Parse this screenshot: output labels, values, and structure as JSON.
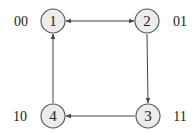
{
  "diagram": {
    "type": "state-graph",
    "nodes": [
      {
        "id": "1",
        "label": "1",
        "code": "00",
        "x": 53,
        "y": 21
      },
      {
        "id": "2",
        "label": "2",
        "code": "01",
        "x": 147,
        "y": 21
      },
      {
        "id": "3",
        "label": "3",
        "code": "11",
        "x": 148,
        "y": 116
      },
      {
        "id": "4",
        "label": "4",
        "code": "10",
        "x": 53,
        "y": 116
      }
    ],
    "edges": [
      {
        "from": "1",
        "to": "2",
        "bidirectional": true
      },
      {
        "from": "2",
        "to": "3",
        "bidirectional": false
      },
      {
        "from": "3",
        "to": "4",
        "bidirectional": false
      },
      {
        "from": "4",
        "to": "1",
        "bidirectional": false
      }
    ],
    "colors": {
      "node_fill": "#ececec",
      "node_stroke": "#555555",
      "edge": "#444444",
      "text": "#222222"
    }
  }
}
